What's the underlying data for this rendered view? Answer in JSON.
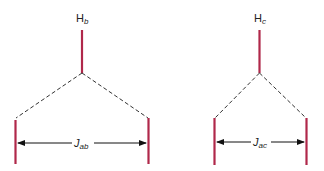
{
  "colors": {
    "bond": "#b0284a",
    "dashed": "#333333",
    "arrow": "#111111",
    "text": "#222222"
  },
  "diagrams": [
    {
      "proton_label": "H",
      "proton_subscript": "b",
      "coupling_label": "J",
      "coupling_subscript": "ab"
    },
    {
      "proton_label": "H",
      "proton_subscript": "c",
      "coupling_label": "J",
      "coupling_subscript": "ac"
    }
  ]
}
